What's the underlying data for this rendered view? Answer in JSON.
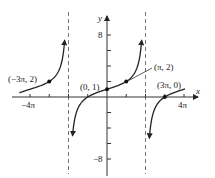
{
  "chart_data": {
    "type": "line",
    "title": "",
    "function": "y = tan(x/4) + 1",
    "xlabel": "x",
    "ylabel": "y",
    "xlim": [
      -4.6,
      4.4
    ],
    "xlim_units": "pi",
    "ylim": [
      -10,
      10
    ],
    "x_ticks": [
      {
        "value_pi": -4,
        "label": "−4π"
      },
      {
        "value_pi": -3,
        "label": ""
      },
      {
        "value_pi": -2,
        "label": ""
      },
      {
        "value_pi": -1,
        "label": ""
      },
      {
        "value_pi": 1,
        "label": ""
      },
      {
        "value_pi": 2,
        "label": ""
      },
      {
        "value_pi": 3,
        "label": ""
      },
      {
        "value_pi": 4,
        "label": "4π"
      }
    ],
    "y_ticks": [
      {
        "value": 8,
        "label": "8"
      },
      {
        "value": 6,
        "label": ""
      },
      {
        "value": 4,
        "label": ""
      },
      {
        "value": 2,
        "label": ""
      },
      {
        "value": -2,
        "label": ""
      },
      {
        "value": -4,
        "label": ""
      },
      {
        "value": -6,
        "label": ""
      },
      {
        "value": -8,
        "label": "−8"
      }
    ],
    "asymptotes_pi": [
      -2,
      2
    ],
    "points": [
      {
        "x_pi": -3,
        "y": 2,
        "label": "(−3π, 2)"
      },
      {
        "x_pi": 0,
        "y": 1,
        "label": "(0, 1)"
      },
      {
        "x_pi": 1,
        "y": 2,
        "label": "(π, 2)"
      },
      {
        "x_pi": 3,
        "y": 0,
        "label": "(3π, 0)"
      }
    ],
    "grid": false,
    "legend": null
  },
  "labels": {
    "x_axis": "x",
    "y_axis": "y",
    "tick_x_neg4pi": "−4π",
    "tick_x_4pi": "4π",
    "tick_y_8": "8",
    "tick_y_neg8": "−8",
    "pt_neg3pi": "(−3π, 2)",
    "pt_origin": "(0, 1)",
    "pt_pi": "(π, 2)",
    "pt_3pi": "(3π, 0)"
  },
  "colors": {
    "curve": "#222222",
    "axis": "#333333",
    "asymptote": "#777777"
  }
}
